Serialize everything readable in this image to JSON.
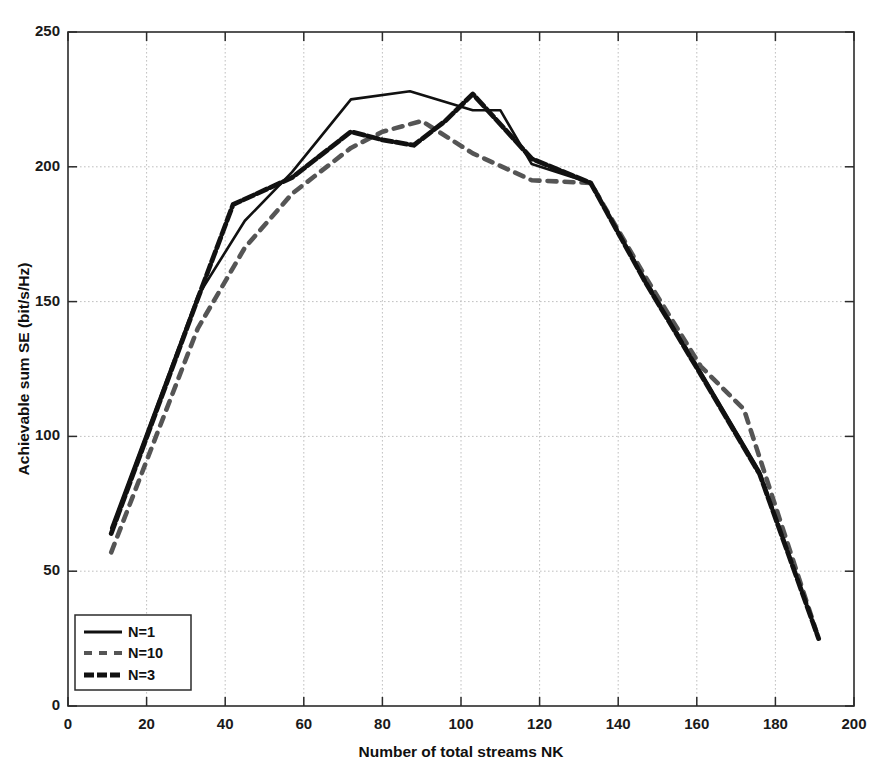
{
  "chart_data": {
    "type": "line",
    "title": "",
    "xlabel": "Number of total streams NK",
    "ylabel": "Achievable sum SE (bit/s/Hz)",
    "xlim": [
      0,
      200
    ],
    "ylim": [
      0,
      250
    ],
    "xticks": [
      0,
      20,
      40,
      60,
      80,
      100,
      120,
      140,
      160,
      180,
      200
    ],
    "yticks": [
      0,
      50,
      100,
      150,
      200,
      250
    ],
    "xtick_labels": [
      "0",
      "20",
      "40",
      "60",
      "80",
      "100",
      "120",
      "140",
      "160",
      "180",
      "200"
    ],
    "ytick_labels": [
      "0",
      "50",
      "100",
      "150",
      "200",
      "250"
    ],
    "grid": true,
    "legend_position": "lower-left",
    "series": [
      {
        "name": "N=1",
        "style": "solid",
        "color": "#111111",
        "x": [
          11,
          33,
          45,
          57,
          72,
          87,
          103,
          110,
          118,
          133,
          147,
          161,
          176,
          191
        ],
        "y": [
          66,
          152,
          180,
          198,
          225,
          228,
          221,
          221,
          201,
          194,
          158,
          124,
          87,
          25
        ]
      },
      {
        "name": "N=10",
        "style": "dashed",
        "color": "#555555",
        "x": [
          11,
          33,
          45,
          57,
          72,
          80,
          90,
          103,
          118,
          133,
          147,
          161,
          172,
          191
        ],
        "y": [
          57,
          140,
          170,
          190,
          207,
          213,
          217,
          205,
          195,
          194,
          159,
          126,
          110,
          25
        ]
      },
      {
        "name": "N=3",
        "style": "dash-dot",
        "color": "#111111",
        "x": [
          11,
          33,
          42,
          57,
          72,
          80,
          88,
          96,
          103,
          118,
          133,
          147,
          161,
          176,
          191
        ],
        "y": [
          64,
          151,
          186,
          196,
          213,
          210,
          208,
          217,
          227,
          203,
          194,
          157,
          123,
          86,
          25
        ]
      }
    ]
  },
  "legend": {
    "entries": [
      {
        "label": "N=1"
      },
      {
        "label": "N=10"
      },
      {
        "label": "N=3"
      }
    ]
  }
}
